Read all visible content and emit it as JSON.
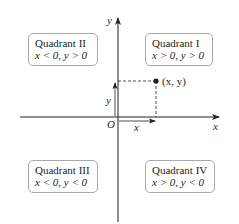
{
  "diagram": {
    "axes": {
      "x_label": "x",
      "y_label": "y",
      "origin_label": "O"
    },
    "point": {
      "label": "(x, y)",
      "x_component_label": "x",
      "y_component_label": "y"
    },
    "quadrants": [
      {
        "id": "I",
        "title": "Quadrant I",
        "condition": "x > 0, y > 0"
      },
      {
        "id": "II",
        "title": "Quadrant II",
        "condition": "x < 0, y > 0"
      },
      {
        "id": "III",
        "title": "Quadrant III",
        "condition": "x < 0, y < 0"
      },
      {
        "id": "IV",
        "title": "Quadrant IV",
        "condition": "x > 0, y < 0"
      }
    ],
    "colors": {
      "ink": "#231f20",
      "box_border": "#a7a9ac"
    }
  }
}
